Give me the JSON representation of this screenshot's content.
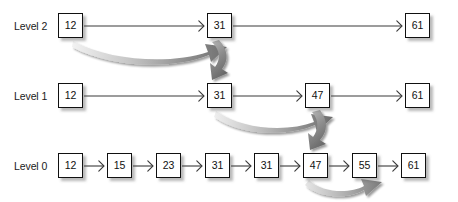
{
  "figure": {
    "type": "skip-list-diagram",
    "background": "#ffffff",
    "box_fill": "#ffffff",
    "box_stroke": "#111111",
    "link_arrow_color": "#3a3a3a",
    "search_arrow_color": "#7d7d7d",
    "shadow_color": "rgba(90,90,90,0.42)"
  },
  "levels": [
    {
      "id": "level-2",
      "label": "Level 2",
      "label_x": 14,
      "label_y": 20,
      "y": 13,
      "nodes": [
        {
          "value": "12",
          "x": 58
        },
        {
          "value": "31",
          "x": 207
        },
        {
          "value": "61",
          "x": 405
        }
      ],
      "links": [
        {
          "from": "12",
          "to": "31",
          "x1": 84,
          "x2": 205,
          "y": 26
        },
        {
          "from": "31",
          "to": "61",
          "x1": 233,
          "x2": 403,
          "y": 26
        }
      ]
    },
    {
      "id": "level-1",
      "label": "Level 1",
      "label_x": 14,
      "label_y": 90,
      "y": 83,
      "nodes": [
        {
          "value": "12",
          "x": 58
        },
        {
          "value": "31",
          "x": 207
        },
        {
          "value": "47",
          "x": 305
        },
        {
          "value": "61",
          "x": 405
        }
      ],
      "links": [
        {
          "from": "12",
          "to": "31",
          "x1": 84,
          "x2": 205,
          "y": 96
        },
        {
          "from": "31",
          "to": "47",
          "x1": 233,
          "x2": 303,
          "y": 96
        },
        {
          "from": "47",
          "to": "61",
          "x1": 331,
          "x2": 403,
          "y": 96
        }
      ]
    },
    {
      "id": "level-0",
      "label": "Level 0",
      "label_x": 14,
      "label_y": 160,
      "y": 153,
      "nodes": [
        {
          "value": "12",
          "x": 58
        },
        {
          "value": "15",
          "x": 107
        },
        {
          "value": "23",
          "x": 156
        },
        {
          "value": "31",
          "x": 205
        },
        {
          "value": "31",
          "x": 254
        },
        {
          "value": "47",
          "x": 303
        },
        {
          "value": "55",
          "x": 352
        },
        {
          "value": "61",
          "x": 401
        }
      ],
      "links": [
        {
          "from": "12",
          "to": "15",
          "x1": 84,
          "x2": 105,
          "y": 166
        },
        {
          "from": "15",
          "to": "23",
          "x1": 133,
          "x2": 154,
          "y": 166
        },
        {
          "from": "23",
          "to": "31",
          "x1": 182,
          "x2": 203,
          "y": 166
        },
        {
          "from": "31",
          "to": "31",
          "x1": 231,
          "x2": 252,
          "y": 166
        },
        {
          "from": "31",
          "to": "47",
          "x1": 280,
          "x2": 301,
          "y": 166
        },
        {
          "from": "47",
          "to": "55",
          "x1": 329,
          "x2": 350,
          "y": 166
        },
        {
          "from": "55",
          "to": "61",
          "x1": 378,
          "x2": 399,
          "y": 166
        }
      ]
    }
  ],
  "search_path": [
    {
      "id": "search-arrow-l2-12-to-31",
      "kind": "curve-right",
      "from_level": "Level 2",
      "from_value": "12",
      "to_level": "Level 2",
      "to_value": "31"
    },
    {
      "id": "search-arrow-l2-31-down-to-l1-31",
      "kind": "curve-down",
      "from_level": "Level 2",
      "from_value": "31",
      "to_level": "Level 1",
      "to_value": "31"
    },
    {
      "id": "search-arrow-l1-31-to-47",
      "kind": "curve-right",
      "from_level": "Level 1",
      "from_value": "31",
      "to_level": "Level 1",
      "to_value": "47"
    },
    {
      "id": "search-arrow-l1-47-down-to-l0-47",
      "kind": "curve-down",
      "from_level": "Level 1",
      "from_value": "47",
      "to_level": "Level 0",
      "to_value": "47"
    },
    {
      "id": "search-arrow-l0-47-to-55",
      "kind": "curve-right-below",
      "from_level": "Level 0",
      "from_value": "47",
      "to_level": "Level 0",
      "to_value": "55"
    }
  ]
}
